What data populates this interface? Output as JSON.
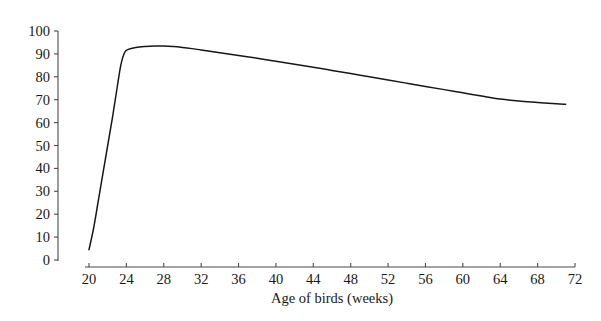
{
  "chart_data": {
    "type": "line",
    "title": "",
    "subtitle": "",
    "xlabel": "Age of birds (weeks)",
    "ylabel": "",
    "xlim": [
      20,
      72
    ],
    "ylim": [
      0,
      100
    ],
    "grid": false,
    "legend": null,
    "legend_position": "none",
    "x_ticks": [
      20,
      24,
      28,
      32,
      36,
      40,
      44,
      48,
      52,
      56,
      60,
      64,
      68,
      72
    ],
    "x_tick_labels": [
      "20",
      "24",
      "28",
      "32",
      "36",
      "40",
      "44",
      "48",
      "52",
      "56",
      "60",
      "64",
      "68",
      "72"
    ],
    "y_ticks": [
      0,
      10,
      20,
      30,
      40,
      50,
      60,
      70,
      80,
      90,
      100
    ],
    "y_tick_labels": [
      "0",
      "10",
      "20",
      "30",
      "40",
      "50",
      "60",
      "70",
      "80",
      "90",
      "100"
    ],
    "series": [
      {
        "name": "Egg production rate",
        "color": "#171717",
        "x": [
          20,
          20.5,
          21,
          21.5,
          22,
          22.5,
          23,
          23.4,
          23.8,
          24.2,
          25,
          26,
          27,
          28,
          29,
          30,
          31,
          32,
          34,
          36,
          38,
          40,
          42,
          44,
          46,
          48,
          50,
          52,
          54,
          56,
          58,
          60,
          62,
          64,
          66,
          68,
          70,
          71
        ],
        "values": [
          4.5,
          14,
          26,
          38,
          50,
          62,
          75,
          85,
          90.5,
          92,
          92.8,
          93.2,
          93.4,
          93.4,
          93.2,
          92.8,
          92.3,
          91.7,
          90.5,
          89.3,
          88.1,
          86.8,
          85.5,
          84.2,
          82.8,
          81.4,
          80.0,
          78.6,
          77.2,
          75.8,
          74.4,
          73.0,
          71.6,
          70.3,
          69.4,
          68.8,
          68.2,
          68.0
        ]
      }
    ],
    "axis_color": "#4a4a4a",
    "background_color": "#ffffff"
  },
  "geometry": {
    "x_axis_pixel_start": 89,
    "x_axis_pixel_end": 575,
    "y_axis_pixel_zero": 260,
    "y_axis_pixel_top": 31,
    "y_axis_x_pixel": 58,
    "x_axis_y_pixel": 267,
    "x_title_pixel_y": 303
  }
}
